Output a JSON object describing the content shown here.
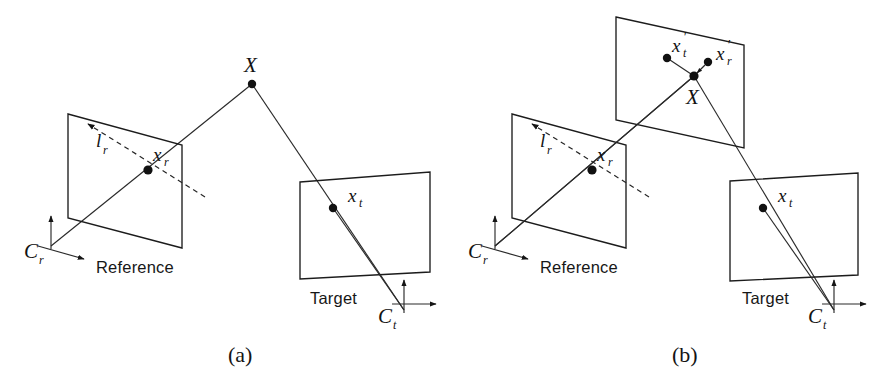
{
  "figure": {
    "background_color": "#ffffff",
    "line_color": "#1c1c1c",
    "point_color": "#111111",
    "width": 896,
    "height": 379
  },
  "panels": [
    {
      "id": "a",
      "caption": "(a)",
      "caption_x": 228,
      "caption_y": 362,
      "planes": [
        {
          "name": "reference-plane",
          "label": "Reference",
          "label_x": 96,
          "label_y": 273,
          "shape": "parallelogram",
          "corners": "68,114 182,145 182,248 68,218"
        },
        {
          "name": "target-plane",
          "label": "Target",
          "label_x": 310,
          "label_y": 304,
          "shape": "quadrilateral",
          "corners": "300,182 430,172 430,272 300,279"
        }
      ],
      "points": [
        {
          "name": "X",
          "label": "X",
          "sub": "",
          "prime": false,
          "x": 252,
          "y": 84,
          "label_x": 244,
          "label_y": 72
        },
        {
          "name": "x_r",
          "label": "x",
          "sub": "r",
          "prime": false,
          "x": 148,
          "y": 170,
          "label_x": 153,
          "label_y": 161
        },
        {
          "name": "x_t",
          "label": "x",
          "sub": "t",
          "prime": false,
          "x": 333,
          "y": 208,
          "label_x": 348,
          "label_y": 202
        }
      ],
      "lines": [
        {
          "name": "epipolar-line-lr",
          "label": "l",
          "sub": "r",
          "style": "dashed",
          "from": "86,123",
          "to": "205,197",
          "label_x": 96,
          "label_y": 147
        },
        {
          "name": "ray-Cr-to-X",
          "style": "solid",
          "from": "51,246",
          "to": "252,84"
        },
        {
          "name": "ray-X-to-Ct",
          "style": "solid",
          "from": "252,84",
          "to": "404,310"
        }
      ],
      "cameras": [
        {
          "name": "C_r",
          "label": "C",
          "sub": "r",
          "origin_x": 51,
          "origin_y": 246,
          "label_x": 24,
          "label_y": 258,
          "up_x": 51,
          "up_y": 215,
          "side_x": 84,
          "side_y": 259
        },
        {
          "name": "C_t",
          "label": "C",
          "sub": "t",
          "origin_x": 404,
          "origin_y": 310,
          "label_x": 378,
          "label_y": 323,
          "up_x": 404,
          "up_y": 279,
          "side_x": 436,
          "side_y": 304
        }
      ]
    },
    {
      "id": "b",
      "caption": "(b)",
      "caption_x": 672,
      "caption_y": 362,
      "planes": [
        {
          "name": "reference-plane",
          "label": "Reference",
          "label_x": 540,
          "label_y": 273,
          "shape": "parallelogram",
          "corners": "512,114 626,145 626,248 512,218"
        },
        {
          "name": "virtual-plane",
          "label": "",
          "label_x": 0,
          "label_y": 0,
          "shape": "parallelogram",
          "corners": "616,17 744,45 744,148 616,120"
        },
        {
          "name": "target-plane",
          "label": "Target",
          "label_x": 742,
          "label_y": 304,
          "shape": "quadrilateral",
          "corners": "730,181 858,173 858,275 730,281"
        }
      ],
      "points": [
        {
          "name": "X",
          "label": "X",
          "sub": "",
          "prime": false,
          "x": 694,
          "y": 76,
          "label_x": 686,
          "label_y": 104
        },
        {
          "name": "x_t_prime",
          "label": "x",
          "sub": "t",
          "prime": true,
          "x": 667,
          "y": 58,
          "label_x": 672,
          "label_y": 52
        },
        {
          "name": "x_r_prime",
          "label": "x",
          "sub": "r",
          "prime": true,
          "x": 708,
          "y": 62,
          "label_x": 716,
          "label_y": 60
        },
        {
          "name": "x_r",
          "label": "x",
          "sub": "r",
          "prime": false,
          "x": 592,
          "y": 170,
          "label_x": 597,
          "label_y": 161
        },
        {
          "name": "x_t",
          "label": "x",
          "sub": "t",
          "prime": false,
          "x": 763,
          "y": 208,
          "label_x": 778,
          "label_y": 202
        }
      ],
      "lines": [
        {
          "name": "epipolar-line-lr",
          "label": "l",
          "sub": "r",
          "style": "dashed",
          "from": "530,123",
          "to": "649,197",
          "label_x": 540,
          "label_y": 147
        },
        {
          "name": "ray-Cr-to-X",
          "style": "solid",
          "from": "495,246",
          "to": "694,76"
        },
        {
          "name": "ray-X-to-Ct",
          "style": "solid",
          "from": "694,76",
          "to": "834,310"
        },
        {
          "name": "segment-X-to-xt-prime",
          "style": "solid",
          "from": "694,76",
          "to": "667,58"
        },
        {
          "name": "correction-arrow-xr-prime-to-X",
          "style": "arrow",
          "from": "708,62",
          "to": "694,76"
        }
      ],
      "cameras": [
        {
          "name": "C_r",
          "label": "C",
          "sub": "r",
          "origin_x": 495,
          "origin_y": 246,
          "label_x": 468,
          "label_y": 258,
          "up_x": 495,
          "up_y": 215,
          "side_x": 528,
          "side_y": 259
        },
        {
          "name": "C_t",
          "label": "C",
          "sub": "t",
          "origin_x": 834,
          "origin_y": 310,
          "label_x": 808,
          "label_y": 323,
          "up_x": 834,
          "up_y": 279,
          "side_x": 866,
          "side_y": 304
        }
      ]
    }
  ]
}
